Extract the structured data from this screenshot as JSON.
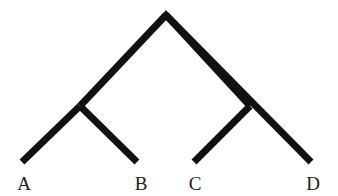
{
  "diagram": {
    "type": "phylogenetic-tree",
    "color": "#111111",
    "nodes": {
      "root": {
        "x": 166,
        "y": 15
      },
      "left_internal": {
        "x": 80,
        "y": 106
      },
      "right_internal": {
        "x": 250,
        "y": 106
      }
    },
    "leaves": [
      {
        "label": "A",
        "x": 24,
        "y": 162,
        "label_x": 24
      },
      {
        "label": "B",
        "x": 136,
        "y": 162,
        "label_x": 141
      },
      {
        "label": "C",
        "x": 195,
        "y": 162,
        "label_x": 195
      },
      {
        "label": "D",
        "x": 310,
        "y": 162,
        "label_x": 313
      }
    ],
    "edges": [
      [
        "root",
        "left_internal"
      ],
      [
        "root",
        "right_internal"
      ],
      [
        "left_internal",
        "A"
      ],
      [
        "left_internal",
        "B"
      ],
      [
        "right_internal",
        "C"
      ],
      [
        "right_internal",
        "D"
      ]
    ]
  }
}
